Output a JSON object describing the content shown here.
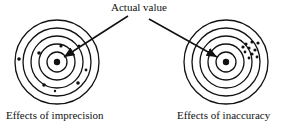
{
  "title": "Actual value",
  "targets": [
    {
      "label": "Effects of imprecision",
      "cx": 57,
      "cy": 62
    },
    {
      "label": "Effects of inaccuracy",
      "cx": 226,
      "cy": 62
    }
  ],
  "colors": {
    "ink": "#111111",
    "background": "#ffffff"
  }
}
